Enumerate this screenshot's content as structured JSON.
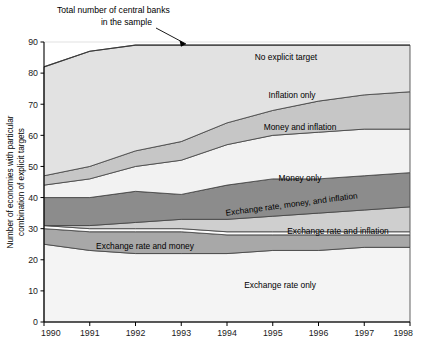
{
  "annotation": {
    "line1": "Total number of central banks",
    "line2": "in the sample"
  },
  "axes": {
    "ylabel_line1": "Number of economies with particular",
    "ylabel_line2": "combination of explicit targets",
    "yticks": [
      "0",
      "10",
      "20",
      "30",
      "40",
      "50",
      "60",
      "70",
      "80",
      "90"
    ],
    "xticks": [
      "1990",
      "1991",
      "1992",
      "1993",
      "1994",
      "1995",
      "1996",
      "1997",
      "1998"
    ]
  },
  "band_labels": {
    "no_explicit_target": "No explicit target",
    "inflation_only": "Inflation only",
    "money_and_inflation": "Money and inflation",
    "money_only": "Money only",
    "er_money_inflation": "Exchange rate, money, and inflation",
    "er_and_inflation": "Exchange rate and inflation",
    "er_and_money": "Exchange rate and money",
    "er_only": "Exchange rate only"
  },
  "colors": {
    "no_explicit_target": "#e2e2e2",
    "inflation_only": "#c6c6c6",
    "money_and_inflation": "#f2f2f2",
    "money_only": "#8c8c8c",
    "er_money_inflation": "#cfcfcf",
    "er_and_inflation": "#fbfbfb",
    "er_and_money": "#a8a8a8",
    "er_only": "#f4f4f4",
    "outline": "#444444",
    "grid": "#d9d9d9",
    "axis": "#000000"
  },
  "chart_data": {
    "type": "area",
    "title": "",
    "xlabel": "",
    "ylabel": "Number of economies with particular combination of explicit targets",
    "x": [
      1990,
      1991,
      1992,
      1993,
      1994,
      1995,
      1996,
      1997,
      1998
    ],
    "ylim": [
      0,
      90
    ],
    "xlim": [
      1990,
      1998
    ],
    "grid": true,
    "legend": "inline-band-labels",
    "stacked": true,
    "series": [
      {
        "name": "Exchange rate only",
        "values": [
          25,
          23,
          22,
          22,
          22,
          23,
          23,
          24,
          24
        ]
      },
      {
        "name": "Exchange rate and money",
        "values": [
          5,
          6,
          7,
          7,
          6,
          5,
          5,
          4,
          4
        ]
      },
      {
        "name": "Exchange rate and inflation",
        "values": [
          1,
          1,
          1,
          1,
          1,
          1,
          1,
          1,
          1
        ]
      },
      {
        "name": "Exchange rate, money, and inflation",
        "values": [
          0,
          1,
          2,
          3,
          4,
          5,
          6,
          7,
          8
        ]
      },
      {
        "name": "Money only",
        "values": [
          9,
          9,
          10,
          8,
          11,
          12,
          11,
          11,
          11
        ]
      },
      {
        "name": "Money and inflation",
        "values": [
          4,
          6,
          8,
          11,
          13,
          14,
          15,
          15,
          14
        ]
      },
      {
        "name": "Inflation only",
        "values": [
          3,
          4,
          5,
          6,
          7,
          8,
          10,
          11,
          12
        ]
      },
      {
        "name": "No explicit target",
        "values": [
          35,
          37,
          34,
          31,
          25,
          21,
          18,
          16,
          15
        ]
      }
    ],
    "total": {
      "name": "Total number of central banks in the sample",
      "values": [
        82,
        87,
        89,
        89,
        89,
        89,
        89,
        89,
        89
      ]
    }
  }
}
